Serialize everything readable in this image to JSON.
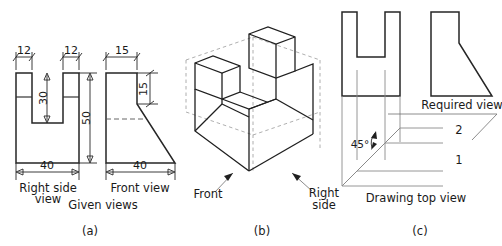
{
  "figure": {
    "panels": [
      {
        "key": "a",
        "caption": "(a)",
        "title": "Given views",
        "views": [
          {
            "name": "Right side view",
            "label_line1": "Right side",
            "label_line2": "view",
            "dimensions": [
              {
                "value": "12",
                "orientation": "horizontal"
              },
              {
                "value": "12",
                "orientation": "horizontal"
              },
              {
                "value": "30",
                "orientation": "vertical"
              },
              {
                "value": "50",
                "orientation": "vertical"
              },
              {
                "value": "40",
                "orientation": "horizontal"
              }
            ]
          },
          {
            "name": "Front view",
            "label_line1": "Front view",
            "dimensions": [
              {
                "value": "15",
                "orientation": "horizontal"
              },
              {
                "value": "15",
                "orientation": "vertical"
              },
              {
                "value": "40",
                "orientation": "horizontal"
              }
            ]
          }
        ]
      },
      {
        "key": "b",
        "caption": "(b)",
        "labels": [
          {
            "text": "Front"
          },
          {
            "text_line1": "Right",
            "text_line2": "side"
          }
        ]
      },
      {
        "key": "c",
        "caption": "(c)",
        "title": "Drawing top view",
        "required_view_label": "Required view",
        "angle_label": "45°",
        "line_labels": [
          "2",
          "1"
        ]
      }
    ]
  },
  "text": {
    "dim_12_left": "12",
    "dim_12_right": "12",
    "dim_30": "30",
    "dim_50": "50",
    "dim_40_side": "40",
    "dim_15_top": "15",
    "dim_15_vert": "15",
    "dim_40_front": "40",
    "right_side_l1": "Right side",
    "right_side_l2": "view",
    "front_view": "Front view",
    "given_views": "Given views",
    "caption_a": "(a)",
    "iso_front": "Front",
    "iso_right_l1": "Right",
    "iso_right_l2": "side",
    "caption_b": "(b)",
    "angle_45": "45°",
    "required_view": "Required view",
    "num_2": "2",
    "num_1": "1",
    "drawing_top_view": "Drawing top view",
    "caption_c": "(c)"
  },
  "colors": {
    "outline": "#262626",
    "hidden": "#555555",
    "construction": "#8a8a8a",
    "background": "#ffffff"
  }
}
